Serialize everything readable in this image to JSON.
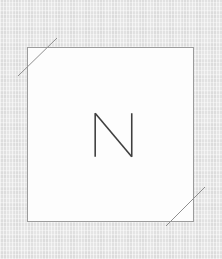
{
  "canvas": {
    "width": 222,
    "height": 259,
    "background_color": "#e5e5e5",
    "texture": "woven-canvas"
  },
  "artboard": {
    "label": "artboard",
    "fill_color": "#fdfdfd",
    "border_color": "#9c9c9c",
    "border_width": 1,
    "x": 27,
    "y": 47,
    "width": 167,
    "height": 175
  },
  "glyph": {
    "character": "N",
    "stroke_color": "#3f3f3f",
    "stroke_width": 1.6,
    "x": 94,
    "y": 113,
    "width": 38,
    "height": 44
  },
  "trim_marks": {
    "stroke_color": "#8f8f8f",
    "stroke_width": 1,
    "marks": [
      {
        "name": "top-left",
        "x1": 57,
        "y1": 38,
        "x2": 18,
        "y2": 76
      },
      {
        "name": "bottom-right",
        "x1": 166,
        "y1": 226,
        "x2": 205,
        "y2": 187
      }
    ]
  }
}
